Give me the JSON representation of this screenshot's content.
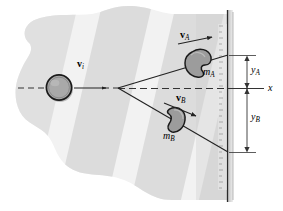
{
  "figure": {
    "labels": {
      "v_initial": "v",
      "v_initial_sub": "i",
      "v_a": "v",
      "v_a_sub": "A",
      "v_b": "v",
      "v_b_sub": "B",
      "m_a": "m",
      "m_a_sub": "A",
      "m_b": "m",
      "m_b_sub": "B",
      "y_a": "y",
      "y_a_sub": "A",
      "y_b": "y",
      "y_b_sub": "B",
      "x_axis": "x"
    },
    "colors": {
      "background": "#ffffff",
      "blob_light": "#f0f0f0",
      "blob_band": "#dedede",
      "blob_band_dark": "#d2d2d2",
      "projectile_fill": "#a8a8a8",
      "projectile_stroke": "#1a1a1a",
      "fragment_fill": "#9e9e9e",
      "fragment_stroke": "#1a1a1a",
      "wall_line": "#2b2b2b",
      "ruler_fill": "#e6e6e6",
      "trajectory": "#222222",
      "dashed_axis": "#333333",
      "dimension_line": "#333333",
      "shadow": "#c9c9c9"
    },
    "geometry": {
      "burst_point_x": 118,
      "burst_point_y": 88,
      "wall_x": 227,
      "axis_y": 89,
      "projectile_center_x": 59,
      "projectile_center_y": 87,
      "projectile_radius": 13,
      "y_a_top": 58,
      "y_a_bottom": 89,
      "y_b_top": 89,
      "y_b_bottom": 152,
      "dim_line_x": 247
    },
    "elements": {
      "projectile": "incoming-projectile",
      "fragment_a": "fragment-a",
      "fragment_b": "fragment-b",
      "wall": "vertical-wall",
      "ruler": "wall-ruler-scale",
      "path_a": "trajectory-a",
      "path_b": "trajectory-b",
      "incoming_path": "incoming-dashed-path",
      "x_axis": "horizontal-x-axis"
    }
  }
}
